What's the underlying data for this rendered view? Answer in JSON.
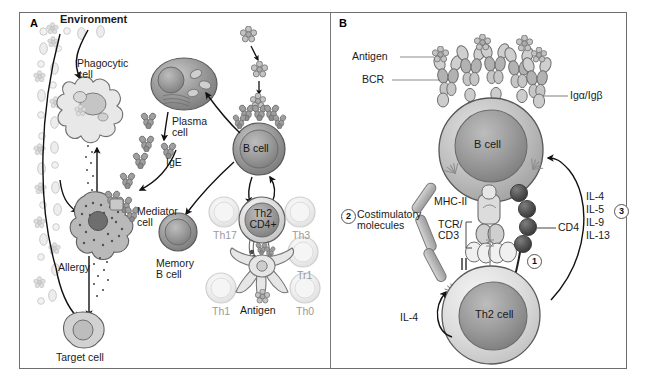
{
  "figure": {
    "width": 646,
    "height": 383,
    "background": "#ffffff",
    "border_color": "#6e6e6e"
  },
  "panels": [
    {
      "letter": "A",
      "name": "allergic-immune-response-overview"
    },
    {
      "letter": "B",
      "name": "b-cell-th2-cell-interaction"
    }
  ],
  "panel_a": {
    "title": "Environment",
    "labels": {
      "environment": "Environment",
      "phagocytic_cell_l1": "Phagocytic",
      "phagocytic_cell_l2": "cell",
      "plasma_cell_l1": "Plasma",
      "plasma_cell_l2": "cell",
      "ige": "IgE",
      "mediator_cell_l1": "Mediator",
      "mediator_cell_l2": "cell",
      "allergy": "Allergy",
      "target_cell": "Target cell",
      "memory_b_cell_l1": "Memory",
      "memory_b_cell_l2": "B cell",
      "b_cell": "B cell",
      "th2_cd4_l1": "Th2",
      "th2_cd4_l2": "CD4+",
      "antigen": "Antigen"
    },
    "t_helper_subsets": [
      {
        "id": "th17",
        "label": "Th17"
      },
      {
        "id": "th3",
        "label": "Th3"
      },
      {
        "id": "tr1",
        "label": "Tr1"
      },
      {
        "id": "th1",
        "label": "Th1"
      },
      {
        "id": "th0",
        "label": "Th0"
      }
    ]
  },
  "panel_b": {
    "labels": {
      "antigen": "Antigen",
      "bcr": "BCR",
      "ig_alpha_beta": "Igα/Igβ",
      "b_cell": "B cell",
      "mhc_ii": "MHC-II",
      "tcr_l1": "TCR/",
      "tcr_l2": "CD3",
      "cd4": "CD4",
      "costimulatory_l1": "Costimulatory",
      "costimulatory_l2": "molecules",
      "th2_cell": "Th2 cell",
      "il4_feedback": "IL-4"
    },
    "markers": [
      {
        "number": "1",
        "name": "signal-1-tcr-mhc"
      },
      {
        "number": "2",
        "name": "signal-2-costimulation"
      },
      {
        "number": "3",
        "name": "signal-3-cytokines"
      }
    ],
    "cytokines": [
      "IL-4",
      "IL-5",
      "IL-9",
      "IL-13"
    ]
  },
  "colors": {
    "outline": "#5a5a5a",
    "cell_gray_dark": "#8d8d8d",
    "cell_gray_mid": "#b5b5b5",
    "cell_gray_light": "#d8d8d8",
    "cell_gray_pale": "#ececec",
    "nucleus": "#8a8a8a",
    "cd4_dark": "#4a4a4a",
    "faded_label": "#9a9a9a",
    "text": "#1a1a1a"
  }
}
